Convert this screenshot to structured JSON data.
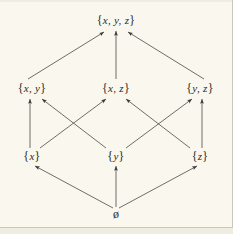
{
  "figure": {
    "type": "hasse-diagram",
    "title": "",
    "background_color": "#faf7ee",
    "ink_color": "#2b2b28",
    "frame_color": "#c9c6bb"
  },
  "nodes": {
    "top": {
      "id": "xyz",
      "label": "{ x, y, z }",
      "open_brace": "{",
      "close_brace": "}",
      "elements": "x, y, z",
      "x": 116,
      "y": 20
    },
    "middle": [
      {
        "id": "xy",
        "label": "{ x, y }",
        "open_brace": "{",
        "close_brace": "}",
        "elements": "x, y",
        "x": 32,
        "y": 88
      },
      {
        "id": "xz",
        "label": "{ x, z }",
        "open_brace": "{",
        "close_brace": "}",
        "elements": "x, z",
        "x": 116,
        "y": 88
      },
      {
        "id": "yz",
        "label": "{ y, z }",
        "open_brace": "{",
        "close_brace": "}",
        "elements": "y, z",
        "x": 200,
        "y": 88
      }
    ],
    "bottom": [
      {
        "id": "x",
        "label": "{ x }",
        "open_brace": "{",
        "close_brace": "}",
        "elements": "x",
        "x": 32,
        "y": 156
      },
      {
        "id": "y",
        "label": "{ y }",
        "open_brace": "{",
        "close_brace": "}",
        "elements": "y",
        "x": 116,
        "y": 156
      },
      {
        "id": "z",
        "label": "{ z }",
        "open_brace": "{",
        "close_brace": "}",
        "elements": "z",
        "x": 200,
        "y": 156
      }
    ],
    "empty": {
      "id": "empty-set",
      "label": "ø",
      "x": 116,
      "y": 214
    }
  },
  "edges": [
    {
      "from": "empty-set",
      "to": "x",
      "x1": 113,
      "y1": 208,
      "x2": 35,
      "y2": 166
    },
    {
      "from": "empty-set",
      "to": "y",
      "x1": 116,
      "y1": 207,
      "x2": 116,
      "y2": 166
    },
    {
      "from": "empty-set",
      "to": "z",
      "x1": 119,
      "y1": 208,
      "x2": 197,
      "y2": 166
    },
    {
      "from": "x",
      "to": "xy",
      "x1": 30,
      "y1": 148,
      "x2": 30,
      "y2": 99
    },
    {
      "from": "x",
      "to": "xz",
      "x1": 40,
      "y1": 148,
      "x2": 106,
      "y2": 99
    },
    {
      "from": "y",
      "to": "xy",
      "x1": 106,
      "y1": 148,
      "x2": 42,
      "y2": 99
    },
    {
      "from": "y",
      "to": "yz",
      "x1": 126,
      "y1": 148,
      "x2": 192,
      "y2": 99
    },
    {
      "from": "z",
      "to": "xz",
      "x1": 190,
      "y1": 148,
      "x2": 126,
      "y2": 99
    },
    {
      "from": "z",
      "to": "yz",
      "x1": 202,
      "y1": 148,
      "x2": 202,
      "y2": 99
    },
    {
      "from": "xy",
      "to": "xyz",
      "x1": 28,
      "y1": 79,
      "x2": 104,
      "y2": 32
    },
    {
      "from": "xz",
      "to": "xyz",
      "x1": 116,
      "y1": 79,
      "x2": 116,
      "y2": 31
    },
    {
      "from": "yz",
      "to": "xyz",
      "x1": 204,
      "y1": 79,
      "x2": 128,
      "y2": 32
    }
  ]
}
